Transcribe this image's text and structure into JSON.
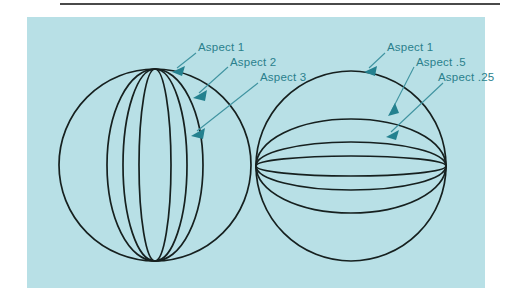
{
  "page": {
    "width": 511,
    "height": 305,
    "background_color": "#ffffff",
    "panel_color": "#b8e0e6",
    "rule_color": "#4a4a4a"
  },
  "figure": {
    "caption": "",
    "ink_color": "#16201f",
    "annotation_color": "#2a7f8c",
    "spheres": [
      {
        "name": "left-sphere",
        "orientation": "vertical-meridians",
        "center_x": 155,
        "center_y": 165,
        "radius": 96,
        "ellipses": [
          {
            "label": "Aspect 1",
            "rx_ratio": 1.0
          },
          {
            "label": "Aspect 2",
            "rx_ratio": 0.5
          },
          {
            "label": "Aspect 3",
            "rx_ratio": 0.33
          }
        ]
      },
      {
        "name": "right-sphere",
        "orientation": "horizontal-latitudes",
        "center_x": 351,
        "center_y": 166,
        "radius": 95,
        "ellipses": [
          {
            "label": "Aspect 1",
            "ry_ratio": 1.0
          },
          {
            "label": "Aspect .5",
            "ry_ratio": 0.5
          },
          {
            "label": "Aspect .25",
            "ry_ratio": 0.25
          }
        ]
      }
    ],
    "callouts": [
      {
        "name": "callout-left-aspect-1",
        "text": "Aspect 1"
      },
      {
        "name": "callout-left-aspect-2",
        "text": "Aspect 2"
      },
      {
        "name": "callout-left-aspect-3",
        "text": "Aspect 3"
      },
      {
        "name": "callout-right-aspect-1",
        "text": "Aspect 1"
      },
      {
        "name": "callout-right-aspect-05",
        "text": "Aspect .5"
      },
      {
        "name": "callout-right-aspect-025",
        "text": "Aspect .25"
      }
    ]
  }
}
